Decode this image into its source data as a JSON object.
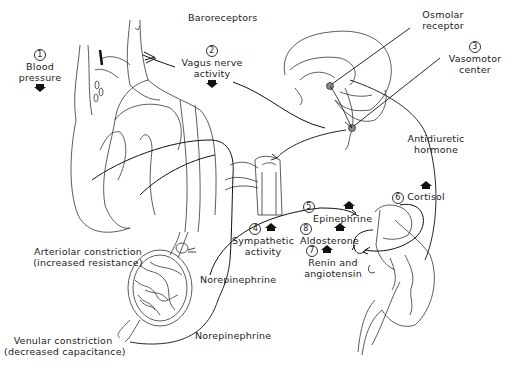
{
  "diagram": {
    "labels": {
      "baroreceptors": "Baroreceptors",
      "osmolar_receptor_line1": "Osmolar",
      "osmolar_receptor_line2": "receptor",
      "blood_pressure": {
        "number": "1",
        "line1": "Blood",
        "line2": "pressure",
        "direction": "down"
      },
      "vagus_nerve": {
        "number": "2",
        "line1": "Vagus nerve",
        "line2": "activity",
        "direction": "down"
      },
      "vasomotor_center": {
        "number": "3",
        "line1": "Vasomotor",
        "line2": "center"
      },
      "antidiuretic_hormone_line1": "Antidiuretic",
      "antidiuretic_hormone_line2": "hormone",
      "sympathetic_activity": {
        "number": "4",
        "line1": "Sympathetic",
        "line2": "activity",
        "direction": "up"
      },
      "epinephrine": {
        "number": "5",
        "label": "Epinephrine",
        "direction": "up"
      },
      "cortisol": {
        "number": "6",
        "label": "Cortisol",
        "direction": "up"
      },
      "renin_angiotensin": {
        "number": "7",
        "line1": "Renin and",
        "line2": "angiotensin",
        "direction": "up"
      },
      "aldosterone": {
        "number": "8",
        "label": "Aldosterone",
        "direction": "up"
      },
      "arteriolar_constriction_line1": "Arteriolar constriction",
      "arteriolar_constriction_line2": "(increased resistance)",
      "venular_constriction_line1": "Venular constriction",
      "venular_constriction_line2": "(decreased capacitance)",
      "norepinephrine_1": "Norepinephrine",
      "norepinephrine_2": "Norepinephrine"
    },
    "structures": [
      "heart-and-aorta",
      "brain-sagittal",
      "spinal-cord-segment",
      "capillary-bed",
      "kidney-and-adrenal-gland"
    ],
    "colors": {
      "line": "#1a1a1a",
      "background": "#ffffff"
    }
  }
}
